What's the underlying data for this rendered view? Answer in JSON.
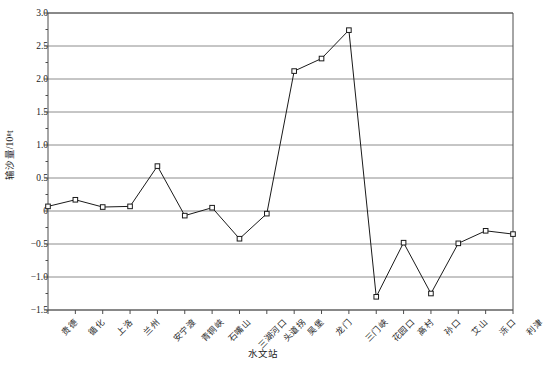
{
  "chart_data": {
    "type": "line",
    "title": "",
    "xlabel": "水文站",
    "ylabel": "输沙量/10⁸t",
    "ylim": [
      -1.5,
      3.0
    ],
    "ytick_step": 0.5,
    "grid": "horizontal",
    "legend": "none",
    "marker": "open-square",
    "line_color": "#1a1a1a",
    "grid_color": "#8c8c8c",
    "axis_color": "#4d4d4d",
    "categories": [
      "贵德",
      "循化",
      "上洛",
      "兰州",
      "安宁渡",
      "青铜峡",
      "石嘴山",
      "三湖河口",
      "头道拐",
      "吴堡",
      "龙门",
      "三门峡",
      "花园口",
      "高村",
      "孙口",
      "艾山",
      "泺口",
      "利津"
    ],
    "values": [
      0.07,
      0.17,
      0.06,
      0.07,
      0.68,
      -0.07,
      0.05,
      -0.42,
      -0.04,
      2.12,
      2.31,
      2.74,
      -1.3,
      -0.48,
      -1.25,
      -0.49,
      -0.3,
      -0.35
    ],
    "yticks": [
      {
        "value": 3.0,
        "label": "3.0"
      },
      {
        "value": 2.5,
        "label": "2.5"
      },
      {
        "value": 2.0,
        "label": "2.0"
      },
      {
        "value": 1.5,
        "label": "1.5"
      },
      {
        "value": 1.0,
        "label": "1.0"
      },
      {
        "value": 0.5,
        "label": "0.5"
      },
      {
        "value": 0.0,
        "label": "0"
      },
      {
        "value": -0.5,
        "label": "−0.5"
      },
      {
        "value": -1.0,
        "label": "−1.0"
      },
      {
        "value": -1.5,
        "label": "−1.5"
      }
    ],
    "yminor": [
      2.75,
      2.25,
      1.75,
      1.25,
      0.75,
      0.25,
      -0.25,
      -0.75,
      -1.25
    ]
  }
}
